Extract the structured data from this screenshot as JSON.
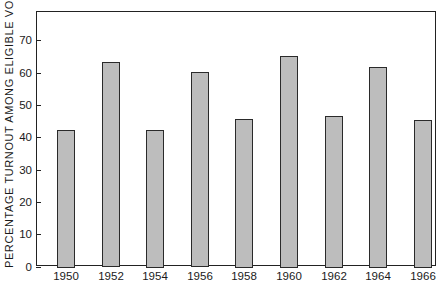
{
  "chart_data": {
    "type": "bar",
    "title": "",
    "xlabel": "",
    "ylabel": "PERCENTAGE TURNOUT AMONG ELIGIBLE VOTERS",
    "categories": [
      "1950",
      "1952",
      "1954",
      "1956",
      "1958",
      "1960",
      "1962",
      "1964",
      "1966"
    ],
    "values": [
      42.4,
      63.2,
      42.4,
      60.1,
      45.7,
      65.3,
      46.7,
      61.8,
      45.5
    ],
    "ylim": [
      0,
      79
    ],
    "yticks": [
      0,
      10,
      20,
      30,
      40,
      50,
      60,
      70
    ],
    "grid": false,
    "legend": null,
    "colors": {
      "bar_fill": "#bdbdbd",
      "bar_edge": "#2a2a2a",
      "axis": "#222222"
    }
  }
}
